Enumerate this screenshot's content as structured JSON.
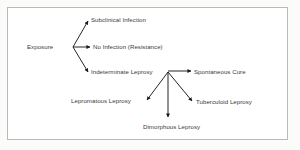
{
  "figure": {
    "type": "flow-diagram",
    "background_color": "#ffffff",
    "page_color": "#fbfbf9",
    "border_color": "#b9b9b9",
    "line_color": "#1a1a1a",
    "text_color": "#3a3a3a"
  },
  "nodes": {
    "exposure": "Exposure",
    "subclinical_infection": "Subclinical Infection",
    "no_infection": "No Infection (Resistance)",
    "indeterminate_leprosy": "Indeterminate Leprosy",
    "spontaneous_cure": "Spontaneous Cure",
    "lepromatous_leprosy": "Lepromatous Leprosy",
    "tuberculoid_leprosy": "Tuberculoid Leprosy",
    "dimorphous_leprosy": "Dimorphous Leprosy"
  },
  "edges": [
    {
      "from": "exposure",
      "to": "subclinical_infection",
      "direction": "up-right"
    },
    {
      "from": "exposure",
      "to": "no_infection",
      "direction": "right"
    },
    {
      "from": "exposure",
      "to": "indeterminate_leprosy",
      "direction": "down-right"
    },
    {
      "from": "indeterminate_leprosy",
      "to": "spontaneous_cure",
      "direction": "right"
    },
    {
      "from": "indeterminate_leprosy",
      "to": "lepromatous_leprosy",
      "direction": "down-left"
    },
    {
      "from": "indeterminate_leprosy",
      "to": "dimorphous_leprosy",
      "direction": "down"
    },
    {
      "from": "indeterminate_leprosy",
      "to": "tuberculoid_leprosy",
      "direction": "down-right"
    }
  ]
}
